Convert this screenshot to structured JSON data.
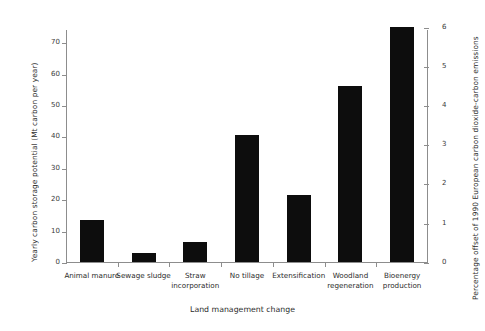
{
  "chart_data": {
    "type": "bar",
    "title": "",
    "categories": [
      "Animal manure",
      "Sewage sludge",
      "Straw incorporation",
      "No tillage",
      "Extensification",
      "Woodland regeneration",
      "Bioenergy production"
    ],
    "category_labels_wrapped": [
      "Animal manure",
      "Sewage sludge",
      "Straw\nincorporation",
      "No tillage",
      "Extensification",
      "Woodland\nregeneration",
      "Bioenergy\nproduction"
    ],
    "values": [
      13.4,
      2.9,
      6.4,
      40.4,
      21.3,
      56.0,
      75.0
    ],
    "secondary_values": [
      1.07,
      0.23,
      0.51,
      3.23,
      1.7,
      4.48,
      6.0
    ],
    "xlabel": "Land management change",
    "ylabel": "Yearly carbon storage potential (Mt carbon per year)",
    "ylabel_right": "Percentage offset of 1990 European carbon dioxide-carbon emissions",
    "ylim": [
      0,
      74.2
    ],
    "ylim_right": [
      0,
      5.936
    ],
    "yticks": [
      0,
      10,
      20,
      30,
      40,
      50,
      60,
      70
    ],
    "yticklabels": [
      "0",
      "10",
      "20",
      "30",
      "40",
      "50",
      "60",
      "70"
    ],
    "yticks_right": [
      0,
      1,
      2,
      3,
      4,
      5,
      6
    ],
    "yticklabels_right": [
      "0",
      "1",
      "2",
      "3",
      "4",
      "5",
      "6"
    ],
    "grid": false,
    "legend": false,
    "bar_color": "#0d0d0d",
    "axis_color": "#8d8d8d",
    "background": "#ffffff"
  }
}
